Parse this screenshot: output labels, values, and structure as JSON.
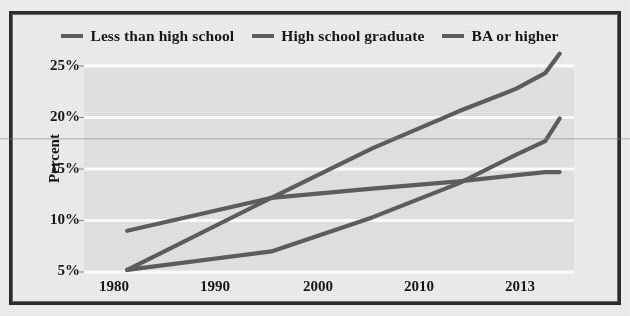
{
  "figure": {
    "background_color": "#efefee",
    "frame_color": "#2c2c2c",
    "plot_background": "#e3e3e1",
    "gridline_color": "#ffffff",
    "series_color": "#5e5e5e"
  },
  "legend": {
    "position": "top-center",
    "items": [
      {
        "label": "Less than high school",
        "marker": "line-swatch",
        "color": "#5e5e5e"
      },
      {
        "label": "High school graduate",
        "marker": "line-swatch",
        "color": "#5e5e5e"
      },
      {
        "label": "BA or higher",
        "marker": "line-swatch",
        "color": "#5e5e5e"
      }
    ]
  },
  "axes": {
    "ylabel": "Percent",
    "xlabel": "",
    "yticks": [
      "25%",
      "20%",
      "15%",
      "10%",
      "5%"
    ],
    "xticks": [
      "1980",
      "1990",
      "2000",
      "2010",
      "2013"
    ]
  },
  "chart_data": {
    "type": "line",
    "title": "",
    "xlabel": "",
    "ylabel": "Percent",
    "xlim": [
      1980,
      2014
    ],
    "ylim": [
      5,
      25
    ],
    "grid": true,
    "legend_position": "top-center",
    "x_tick_values": [
      1980,
      1990,
      2000,
      2010,
      2013
    ],
    "x_tick_labels": [
      "1980",
      "1990",
      "2000",
      "2010",
      "2013"
    ],
    "y_tick_values": [
      5,
      10,
      15,
      20,
      25
    ],
    "y_tick_labels": [
      "5%",
      "10%",
      "15%",
      "20%",
      "25%"
    ],
    "series": [
      {
        "name": "Less than high school",
        "color": "#5e5e5e",
        "x": [
          1983,
          1993,
          2000,
          2006,
          2010,
          2012,
          2013
        ],
        "values": [
          9.0,
          12.2,
          13.1,
          13.8,
          14.4,
          14.7,
          14.7
        ]
      },
      {
        "name": "High school graduate",
        "color": "#5e5e5e",
        "x": [
          1983,
          1993,
          2000,
          2006,
          2010,
          2012,
          2013
        ],
        "values": [
          5.2,
          7.0,
          10.3,
          13.6,
          16.4,
          17.7,
          19.9
        ]
      },
      {
        "name": "BA or higher",
        "color": "#5e5e5e",
        "x": [
          1983,
          1993,
          2000,
          2006,
          2010,
          2012,
          2013
        ],
        "values": [
          5.2,
          12.2,
          17.0,
          20.6,
          22.8,
          24.3,
          26.2
        ]
      }
    ]
  }
}
